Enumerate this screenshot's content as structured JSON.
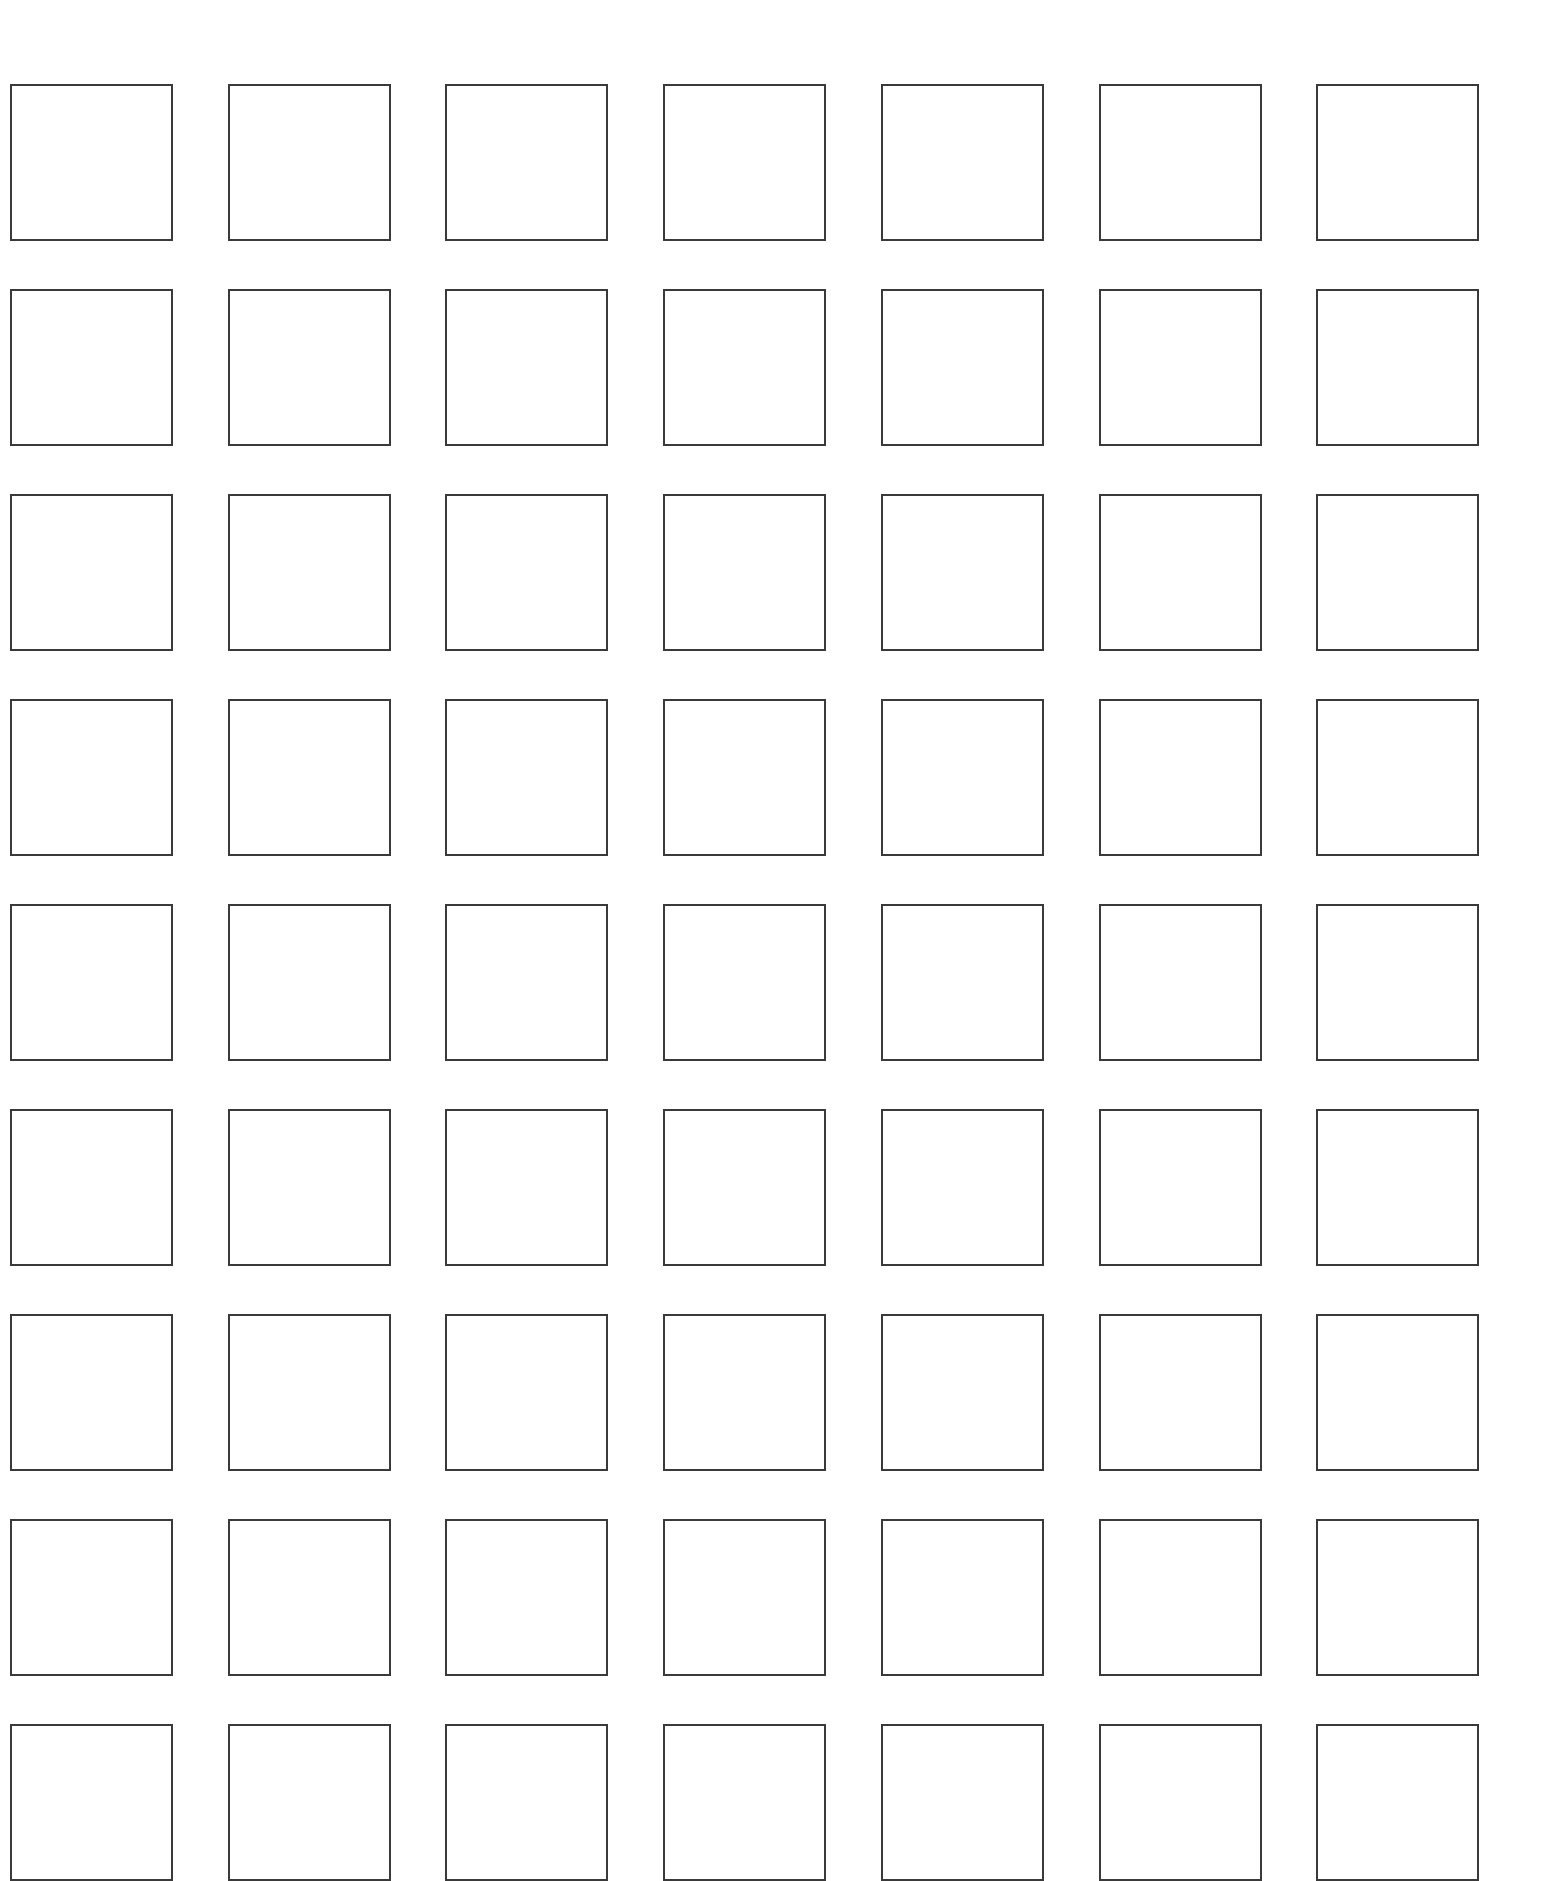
{
  "page": {
    "background": "#ffffff",
    "border_color": "#3a3a3a"
  },
  "grid": {
    "rows": 9,
    "columns": 7,
    "cell_content": "empty",
    "box_width_px": 163,
    "box_height_px": 157,
    "origin_x_px": 10,
    "origin_y_px": 84,
    "column_step_px": 217.7,
    "row_step_px": 205,
    "cells": [
      [
        "",
        "",
        "",
        "",
        "",
        "",
        ""
      ],
      [
        "",
        "",
        "",
        "",
        "",
        "",
        ""
      ],
      [
        "",
        "",
        "",
        "",
        "",
        "",
        ""
      ],
      [
        "",
        "",
        "",
        "",
        "",
        "",
        ""
      ],
      [
        "",
        "",
        "",
        "",
        "",
        "",
        ""
      ],
      [
        "",
        "",
        "",
        "",
        "",
        "",
        ""
      ],
      [
        "",
        "",
        "",
        "",
        "",
        "",
        ""
      ],
      [
        "",
        "",
        "",
        "",
        "",
        "",
        ""
      ],
      [
        "",
        "",
        "",
        "",
        "",
        "",
        ""
      ]
    ]
  }
}
